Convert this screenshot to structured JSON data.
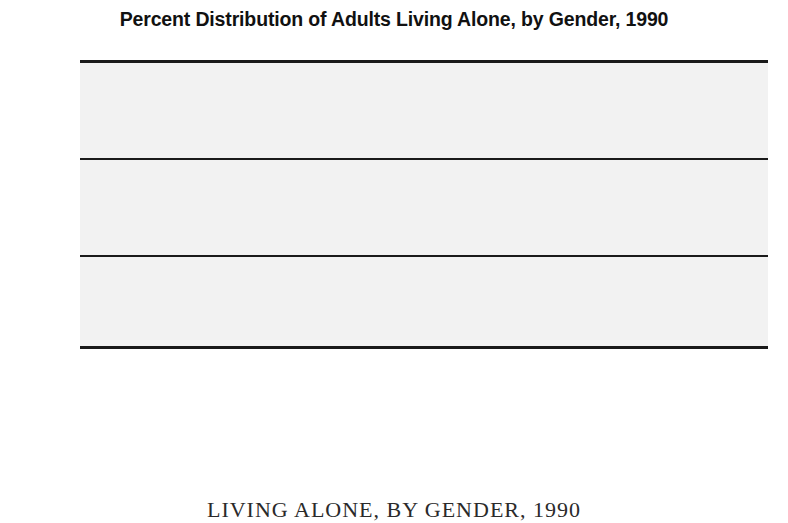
{
  "chart_data": {
    "type": "bar",
    "title": "Percent Distribution of Adults Living Alone, by Gender, 1990",
    "xlabel": "",
    "ylabel": "",
    "ylim": [
      0,
      30
    ],
    "yticks": [
      {
        "value": 30,
        "label": "30%"
      },
      {
        "value": 20,
        "label": "20"
      },
      {
        "value": 10,
        "label": "10"
      },
      {
        "value": 0,
        "label": "0"
      }
    ],
    "grid": true,
    "legend_position": "bottom-left",
    "categories": [
      "15–24",
      "25–34",
      "35–44",
      "45–54",
      "55–64",
      "65–74",
      "75 and\nolder"
    ],
    "series": [
      {
        "name": "Men",
        "color": "#e6e6e6",
        "values": [
          7.3,
          26.3,
          20.5,
          12.9,
          11.3,
          11.9,
          10.3
        ]
      },
      {
        "name": "Women",
        "color": "#b4b4b4",
        "values": [
          3.7,
          11.2,
          9.3,
          9.2,
          14.4,
          24.2,
          26.3
        ]
      }
    ]
  },
  "caption": "LIVING ALONE, BY GENDER, 1990"
}
